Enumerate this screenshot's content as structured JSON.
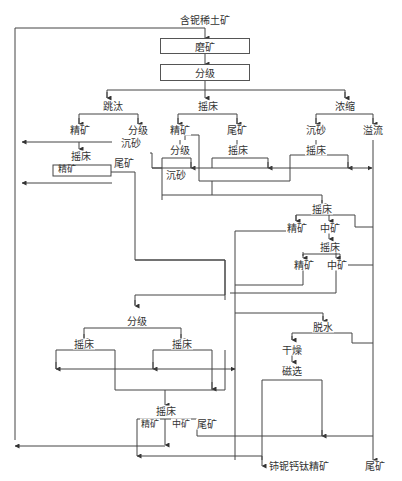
{
  "diagram": {
    "type": "process_flowsheet",
    "feed": "含铌稀土矿",
    "boxes": {
      "grinding": "磨矿",
      "classification": "分级"
    },
    "branches": {
      "jig": "跳汰",
      "table_main": "摇床",
      "thicken": "浓缩"
    },
    "labels": {
      "jig_conc": "精矿",
      "jig_classify": "分级",
      "jig_sand": "沉砂",
      "jig_table": "摇床",
      "jig_table_conc": "精矿",
      "jig_table_tail": "尾矿",
      "table_conc": "精矿",
      "table_tail": "尾矿",
      "table_conc_classify": "分级",
      "table_conc_sand": "沉砂",
      "table_tail_table": "摇床",
      "thicken_sand": "沉砂",
      "thicken_overflow": "溢流",
      "thicken_sand_table": "摇床",
      "table2": "摇床",
      "table2_conc": "精矿",
      "table2_mid": "中矿",
      "table3": "摇床",
      "table3_conc": "精矿",
      "table3_mid": "中矿",
      "lower_classify": "分级",
      "lower_table_left": "摇床",
      "lower_table_right": "摇床",
      "dewater": "脱水",
      "dry": "干燥",
      "magnetic": "磁选",
      "final_table": "摇床",
      "final_conc": "精矿",
      "final_mid": "中矿",
      "final_tail": "尾矿",
      "product": "铈铌钙钛精矿",
      "tailings": "尾矿"
    }
  }
}
